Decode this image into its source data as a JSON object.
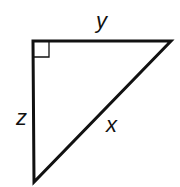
{
  "diagram": {
    "type": "right-triangle",
    "labels": {
      "top_side": "y",
      "left_side": "z",
      "hypotenuse": "x"
    },
    "right_angle_marker": true,
    "stroke_color": "#111111",
    "background": "#ffffff"
  }
}
